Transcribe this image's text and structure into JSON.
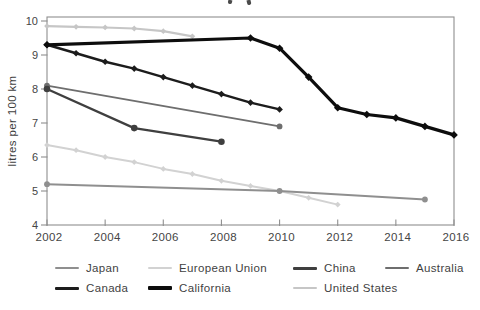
{
  "chart_data": {
    "type": "line",
    "ylabel": "litres per 100 km",
    "xlabel": "",
    "xlim": [
      2002,
      2016
    ],
    "ylim": [
      4,
      10
    ],
    "grid": false,
    "legend_position": "bottom",
    "x_tick_labels": [
      "2002",
      "2004",
      "2006",
      "2008",
      "2010",
      "2012",
      "2014",
      "2016"
    ],
    "y_tick_labels": [
      "4",
      "5",
      "6",
      "7",
      "8",
      "9",
      "10"
    ],
    "axis_color": "#8f8f8f",
    "text_color": "#454545",
    "series": [
      {
        "name": "Japan",
        "slug": "japan",
        "color": "#8f8f8f",
        "marker": "circle",
        "width": 1.9,
        "points": [
          [
            2002,
            5.2
          ],
          [
            2010,
            5.0
          ],
          [
            2015,
            4.75
          ]
        ]
      },
      {
        "name": "European Union",
        "slug": "european-union",
        "color": "#d2d2d2",
        "marker": "diamond",
        "width": 2,
        "points": [
          [
            2002,
            6.35
          ],
          [
            2003,
            6.2
          ],
          [
            2004,
            6.0
          ],
          [
            2005,
            5.85
          ],
          [
            2006,
            5.65
          ],
          [
            2007,
            5.5
          ],
          [
            2008,
            5.3
          ],
          [
            2009,
            5.15
          ],
          [
            2010,
            5.0
          ],
          [
            2011,
            4.8
          ],
          [
            2012,
            4.6
          ]
        ]
      },
      {
        "name": "China",
        "slug": "china",
        "color": "#3f3f3f",
        "marker": "circle",
        "width": 2.3,
        "points": [
          [
            2002,
            8.0
          ],
          [
            2005,
            6.85
          ],
          [
            2008,
            6.45
          ]
        ]
      },
      {
        "name": "Australia",
        "slug": "australia",
        "color": "#6e6e6e",
        "marker": "circle",
        "width": 1.9,
        "points": [
          [
            2002,
            8.1
          ],
          [
            2010,
            6.9
          ]
        ]
      },
      {
        "name": "Canada",
        "slug": "canada",
        "color": "#1c1c1c",
        "marker": "diamond",
        "width": 2.5,
        "points": [
          [
            2002,
            9.3
          ],
          [
            2003,
            9.05
          ],
          [
            2004,
            8.8
          ],
          [
            2005,
            8.6
          ],
          [
            2006,
            8.35
          ],
          [
            2007,
            8.1
          ],
          [
            2008,
            7.85
          ],
          [
            2009,
            7.6
          ],
          [
            2010,
            7.4
          ]
        ]
      },
      {
        "name": "California",
        "slug": "california",
        "color": "#0d0d0d",
        "marker": "diamond",
        "width": 3.2,
        "points": [
          [
            2002,
            9.3
          ],
          [
            2009,
            9.5
          ],
          [
            2010,
            9.2
          ],
          [
            2011,
            8.35
          ],
          [
            2012,
            7.45
          ],
          [
            2013,
            7.25
          ],
          [
            2014,
            7.15
          ],
          [
            2015,
            6.9
          ],
          [
            2016,
            6.65
          ]
        ]
      },
      {
        "name": "United States",
        "slug": "united-states",
        "color": "#c6c6c6",
        "marker": "diamond",
        "width": 2.2,
        "points": [
          [
            2002,
            9.85
          ],
          [
            2003,
            9.83
          ],
          [
            2004,
            9.81
          ],
          [
            2005,
            9.78
          ],
          [
            2006,
            9.7
          ],
          [
            2007,
            9.55
          ]
        ]
      }
    ]
  },
  "legend": {
    "rows": [
      [
        0,
        1,
        2,
        3
      ],
      [
        4,
        5,
        6
      ]
    ]
  }
}
